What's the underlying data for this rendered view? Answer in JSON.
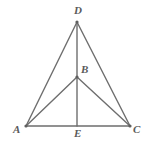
{
  "figure": {
    "background_color": "#ffffff",
    "stroke_color": "#6e6e6e",
    "label_color": "#5a5a5a",
    "stroke_width": 1.4,
    "points": {
      "D": {
        "label": "D",
        "x": 77,
        "y": 22
      },
      "B": {
        "label": "B",
        "x": 77,
        "y": 77
      },
      "A": {
        "label": "A",
        "x": 26,
        "y": 126
      },
      "C": {
        "label": "C",
        "x": 130,
        "y": 126
      },
      "E": {
        "label": "E",
        "x": 77,
        "y": 126
      }
    },
    "segments": [
      {
        "name": "segment-AD",
        "from": "A",
        "to": "D"
      },
      {
        "name": "segment-DC",
        "from": "D",
        "to": "C"
      },
      {
        "name": "segment-AC",
        "from": "A",
        "to": "C"
      },
      {
        "name": "segment-DE",
        "from": "D",
        "to": "E"
      },
      {
        "name": "segment-AB",
        "from": "A",
        "to": "B"
      },
      {
        "name": "segment-BC",
        "from": "B",
        "to": "C"
      }
    ]
  }
}
